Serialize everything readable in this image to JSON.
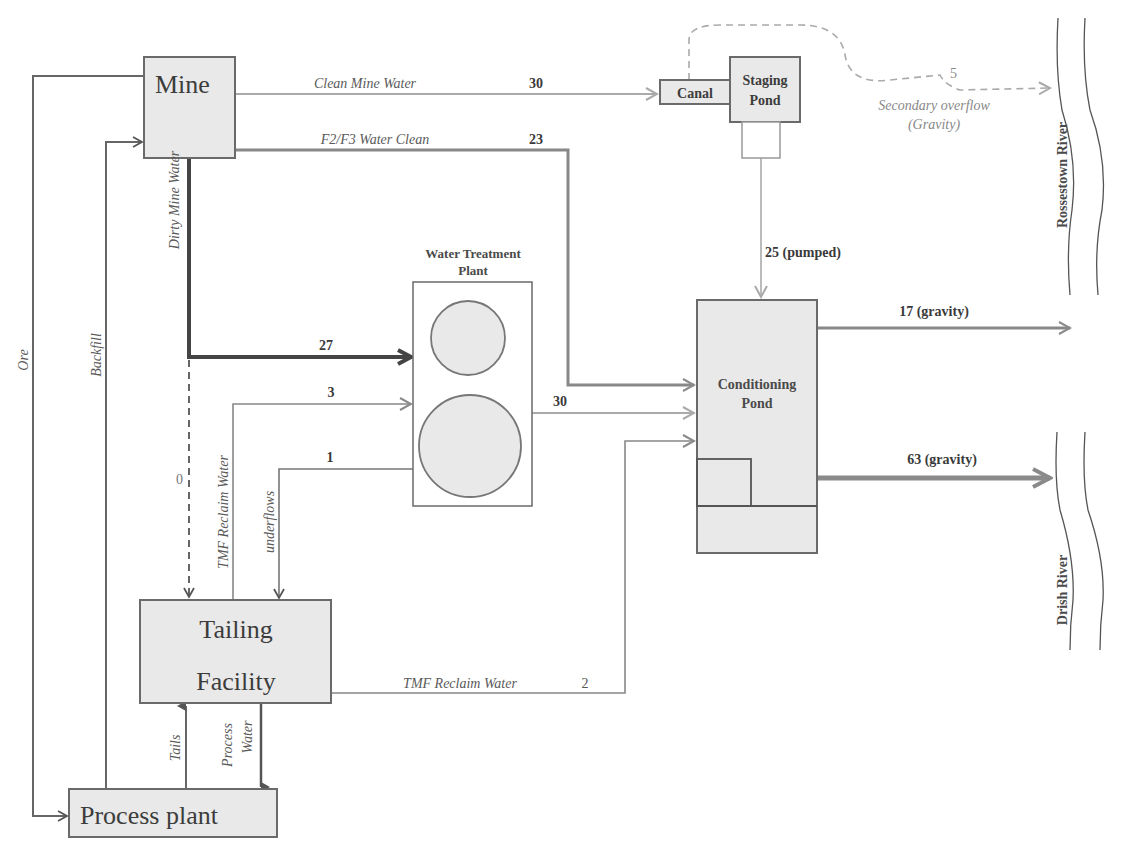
{
  "diagram": {
    "type": "water-flow-diagram",
    "nodes": {
      "mine": {
        "label": "Mine"
      },
      "canal": {
        "label": "Canal"
      },
      "staging_pond": {
        "line1": "Staging",
        "line2": "Pond"
      },
      "water_treatment_plant": {
        "line1": "Water Treatment",
        "line2": "Plant"
      },
      "conditioning_pond": {
        "line1": "Conditioning",
        "line2": "Pond"
      },
      "tailing_facility": {
        "line1": "Tailing",
        "line2": "Facility"
      },
      "process_plant": {
        "label": "Process plant"
      },
      "rossestown_river": {
        "label": "Rossestown River"
      },
      "drish_river": {
        "label": "Drish River"
      }
    },
    "flows": {
      "clean_mine_water": {
        "label": "Clean Mine Water",
        "value": "30"
      },
      "f2f3_water_clean": {
        "label": "F2/F3 Water Clean",
        "value": "23"
      },
      "secondary_overflow": {
        "label1": "Secondary overflow",
        "label2": "(Gravity)",
        "value": "5"
      },
      "staging_to_conditioning": {
        "value": "25 (pumped)"
      },
      "dirty_mine_water": {
        "label": "Dirty Mine Water",
        "value": "27"
      },
      "dirty_to_tailing": {
        "value": "0"
      },
      "tmf_reclaim_to_wtp": {
        "label": "TMF Reclaim Water",
        "value": "3"
      },
      "underflows": {
        "label": "underflows",
        "value": "1"
      },
      "wtp_to_conditioning": {
        "value": "30"
      },
      "tmf_reclaim_to_conditioning": {
        "label": "TMF Reclaim Water",
        "value": "2"
      },
      "to_rossestown": {
        "value": "17 (gravity)"
      },
      "to_drish": {
        "value": "63 (gravity)"
      },
      "ore": {
        "label": "Ore"
      },
      "backfill": {
        "label": "Backfill"
      },
      "tails": {
        "label": "Tails"
      },
      "process_water": {
        "label1": "Process",
        "label2": "Water"
      }
    },
    "colors": {
      "dark_line": "#555555",
      "mid_line": "#7a7a7a",
      "light_line": "#a8a8a8",
      "box_fill": "#e9e9e9",
      "box_stroke": "#6a6a6a"
    }
  }
}
